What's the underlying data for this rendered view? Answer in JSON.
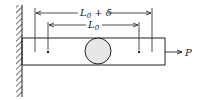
{
  "diagram": {
    "type": "bar-under-tension",
    "labels": {
      "outer_dimension": {
        "main": "L",
        "sub": "0",
        "suffix": " + δ"
      },
      "inner_dimension": {
        "main": "L",
        "sub": "0"
      },
      "force": "P"
    },
    "elements": [
      "fixed-wall",
      "bar",
      "hole",
      "gauge-marks",
      "dimension-lines",
      "force-arrow"
    ],
    "colors": {
      "line": "#222222",
      "hole_fill": "#e6e6e6"
    }
  }
}
